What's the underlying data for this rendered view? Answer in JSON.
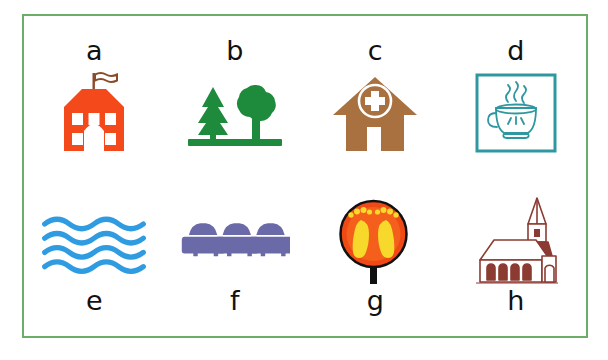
{
  "figure": {
    "type": "pictogram-grid",
    "border_color": "#6aae6a",
    "background_color": "#ffffff",
    "rows": 2,
    "columns": 4
  },
  "items": [
    {
      "label": "a",
      "label_position": "above",
      "icon_name": "school-building-icon",
      "description": "orange school building with flag",
      "colors": {
        "primary": "#f4491a",
        "accent": "#8a4b2a"
      }
    },
    {
      "label": "b",
      "label_position": "above",
      "icon_name": "trees-park-icon",
      "description": "green pine tree and deciduous tree on ground line",
      "colors": {
        "primary": "#1e8a3c"
      }
    },
    {
      "label": "c",
      "label_position": "above",
      "icon_name": "hospital-clinic-icon",
      "description": "brown house with medical cross in circle",
      "colors": {
        "primary": "#a9713f",
        "accent": "#ffffff"
      }
    },
    {
      "label": "d",
      "label_position": "above",
      "icon_name": "coffee-cup-icon",
      "description": "teal outlined square with steaming teacup",
      "colors": {
        "primary": "#2e97a0"
      }
    },
    {
      "label": "e",
      "label_position": "below",
      "icon_name": "water-waves-icon",
      "description": "four blue wavy lines representing water",
      "colors": {
        "primary": "#2f9be0"
      }
    },
    {
      "label": "f",
      "label_position": "below",
      "icon_name": "cars-parking-icon",
      "description": "three purple cars seen from the front",
      "colors": {
        "primary": "#6b6aa8"
      }
    },
    {
      "label": "g",
      "label_position": "below",
      "icon_name": "footprints-sign-icon",
      "description": "round orange sign with yellow footprints on black post",
      "colors": {
        "primary": "#ef4a16",
        "accent": "#f7d92b",
        "post": "#111111"
      }
    },
    {
      "label": "h",
      "label_position": "below",
      "icon_name": "church-icon",
      "description": "dark red line drawing of church with steeple",
      "colors": {
        "primary": "#8c3b32"
      }
    }
  ]
}
